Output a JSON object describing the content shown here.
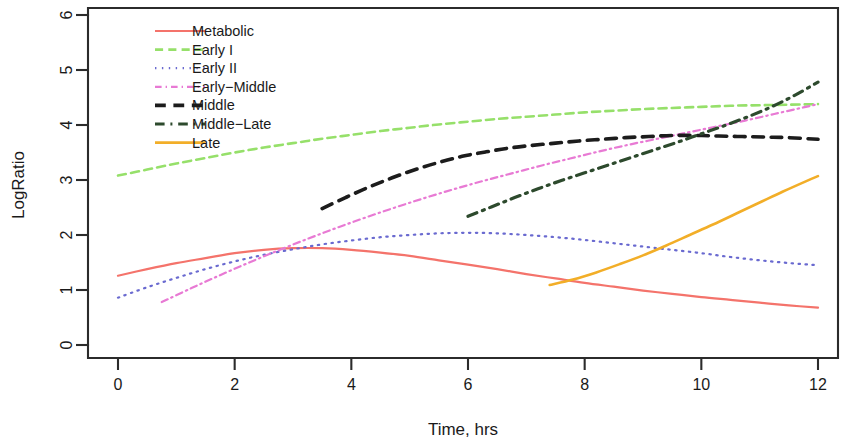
{
  "chart_data": {
    "type": "line",
    "title": "",
    "xlabel": "Time, hrs",
    "ylabel": "LogRatio",
    "xlim": [
      -0.35,
      12.45
    ],
    "ylim": [
      -0.25,
      6.35
    ],
    "xticks": [
      0,
      2,
      4,
      6,
      8,
      10,
      12
    ],
    "yticks": [
      0,
      1,
      2,
      3,
      4,
      5,
      6
    ],
    "xtick_labels": [
      "0",
      "2",
      "4",
      "6",
      "8",
      "10",
      "12"
    ],
    "ytick_labels": [
      "0",
      "1",
      "2",
      "3",
      "4",
      "5",
      "6"
    ],
    "grid": false,
    "legend_position": "top-left",
    "series": [
      {
        "name": "Metabolic",
        "color": "#f4736b",
        "dash": "solid",
        "width": 2.2,
        "x": [
          0.0,
          0.5,
          1.0,
          1.5,
          2.0,
          2.5,
          3.0,
          3.5,
          4.0,
          4.5,
          5.0,
          5.5,
          6.0,
          6.5,
          7.0,
          7.5,
          8.0,
          8.5,
          9.0,
          9.5,
          10.0,
          10.5,
          11.0,
          11.5,
          12.0
        ],
        "y": [
          1.26,
          1.38,
          1.49,
          1.58,
          1.67,
          1.73,
          1.76,
          1.76,
          1.73,
          1.68,
          1.62,
          1.54,
          1.46,
          1.38,
          1.29,
          1.21,
          1.13,
          1.06,
          0.99,
          0.93,
          0.87,
          0.82,
          0.77,
          0.72,
          0.68
        ]
      },
      {
        "name": "Early I",
        "color": "#96e06a",
        "dash": "dashed",
        "width": 2.6,
        "x": [
          0.0,
          0.5,
          1.0,
          1.5,
          2.0,
          2.5,
          3.0,
          3.5,
          4.0,
          4.5,
          5.0,
          5.5,
          6.0,
          6.5,
          7.0,
          7.5,
          8.0,
          8.5,
          9.0,
          9.5,
          10.0,
          10.5,
          11.0,
          11.5,
          12.0
        ],
        "y": [
          3.08,
          3.19,
          3.3,
          3.4,
          3.5,
          3.59,
          3.67,
          3.75,
          3.82,
          3.89,
          3.95,
          4.01,
          4.06,
          4.11,
          4.15,
          4.19,
          4.23,
          4.26,
          4.29,
          4.31,
          4.33,
          4.35,
          4.36,
          4.37,
          4.38
        ]
      },
      {
        "name": "Early II",
        "color": "#6a6ad0",
        "dash": "dotted",
        "width": 2.2,
        "x": [
          0.0,
          0.5,
          1.0,
          1.5,
          2.0,
          2.5,
          3.0,
          3.5,
          4.0,
          4.5,
          5.0,
          5.5,
          6.0,
          6.5,
          7.0,
          7.5,
          8.0,
          8.5,
          9.0,
          9.5,
          10.0,
          10.5,
          11.0,
          11.5,
          12.0
        ],
        "y": [
          0.86,
          1.05,
          1.22,
          1.38,
          1.52,
          1.64,
          1.74,
          1.83,
          1.9,
          1.96,
          2.0,
          2.03,
          2.04,
          2.03,
          2.0,
          1.96,
          1.91,
          1.85,
          1.79,
          1.73,
          1.67,
          1.6,
          1.54,
          1.49,
          1.45
        ]
      },
      {
        "name": "Early-Middle",
        "color": "#e87ad4",
        "dash": "dashdot",
        "width": 2.2,
        "x": [
          0.75,
          1.25,
          1.75,
          2.25,
          2.75,
          3.25,
          3.75,
          4.25,
          4.75,
          5.25,
          5.75,
          6.25,
          6.75,
          7.25,
          7.75,
          8.25,
          8.75,
          9.25,
          9.75,
          10.25,
          10.75,
          11.25,
          11.75,
          12.0
        ],
        "y": [
          0.78,
          1.03,
          1.27,
          1.5,
          1.72,
          1.93,
          2.13,
          2.32,
          2.5,
          2.67,
          2.83,
          2.98,
          3.12,
          3.26,
          3.39,
          3.52,
          3.64,
          3.75,
          3.86,
          3.97,
          4.08,
          4.2,
          4.32,
          4.38
        ]
      },
      {
        "name": "Middle",
        "color": "#1c1c1c",
        "dash": "dashed-wide",
        "width": 3.6,
        "x": [
          3.5,
          3.9,
          4.3,
          4.7,
          5.1,
          5.5,
          5.9,
          6.3,
          6.7,
          7.1,
          7.5,
          7.9,
          8.3,
          8.7,
          9.1,
          9.5,
          9.9,
          10.3,
          10.7,
          11.1,
          11.5,
          12.0
        ],
        "y": [
          2.48,
          2.68,
          2.87,
          3.04,
          3.19,
          3.32,
          3.43,
          3.51,
          3.58,
          3.63,
          3.67,
          3.71,
          3.74,
          3.77,
          3.79,
          3.81,
          3.81,
          3.8,
          3.79,
          3.78,
          3.77,
          3.74
        ]
      },
      {
        "name": "Middle-Late",
        "color": "#2d4a2d",
        "dash": "dashdot",
        "width": 3.2,
        "x": [
          6.0,
          6.4,
          6.8,
          7.2,
          7.6,
          8.0,
          8.4,
          8.8,
          9.2,
          9.6,
          10.0,
          10.4,
          10.8,
          11.2,
          11.6,
          12.0
        ],
        "y": [
          2.34,
          2.51,
          2.68,
          2.84,
          2.99,
          3.13,
          3.27,
          3.41,
          3.55,
          3.69,
          3.84,
          3.99,
          4.15,
          4.33,
          4.54,
          4.78
        ]
      },
      {
        "name": "Late",
        "color": "#f2ae28",
        "dash": "solid",
        "width": 2.6,
        "x": [
          7.4,
          7.8,
          8.2,
          8.6,
          9.0,
          9.4,
          9.8,
          10.2,
          10.6,
          11.0,
          11.4,
          11.8,
          12.0
        ],
        "y": [
          1.09,
          1.19,
          1.32,
          1.47,
          1.63,
          1.81,
          2.0,
          2.19,
          2.39,
          2.59,
          2.79,
          2.98,
          3.07
        ]
      }
    ]
  },
  "legend": {
    "entries": [
      {
        "label": "Metabolic"
      },
      {
        "label": "Early I"
      },
      {
        "label": "Early II"
      },
      {
        "label": "Early−Middle"
      },
      {
        "label": "Middle"
      },
      {
        "label": "Middle−Late"
      },
      {
        "label": "Late"
      }
    ]
  },
  "colors": {
    "axis": "#2b2b2b",
    "text": "#1a1a1a",
    "background": "#ffffff"
  }
}
